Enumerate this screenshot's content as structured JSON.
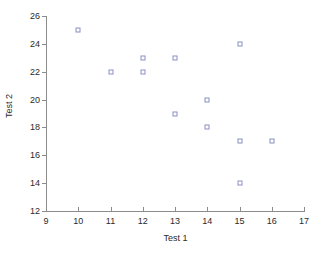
{
  "chart_data": {
    "type": "scatter",
    "title": "",
    "xlabel": "Test 1",
    "ylabel": "Test 2",
    "xlim": [
      9,
      17
    ],
    "ylim": [
      12,
      26
    ],
    "grid": false,
    "legend": null,
    "x_ticks": [
      9,
      10,
      11,
      12,
      13,
      14,
      15,
      16,
      17
    ],
    "x_tick_labels": [
      "9",
      "10",
      "11",
      "12",
      "13",
      "14",
      "15",
      "16",
      "17"
    ],
    "y_ticks": [
      12,
      14,
      16,
      18,
      20,
      22,
      24,
      26
    ],
    "y_tick_labels": [
      "12",
      "14",
      "16",
      "18",
      "20",
      "22",
      "24",
      "26"
    ],
    "marker": "open-square",
    "marker_color": "#8a8fc4",
    "axis_color": "#8c8c8c",
    "points": [
      {
        "x": 10,
        "y": 25
      },
      {
        "x": 11,
        "y": 22
      },
      {
        "x": 12,
        "y": 23
      },
      {
        "x": 12,
        "y": 22
      },
      {
        "x": 13,
        "y": 23
      },
      {
        "x": 13,
        "y": 19
      },
      {
        "x": 14,
        "y": 20
      },
      {
        "x": 14,
        "y": 18
      },
      {
        "x": 15,
        "y": 24
      },
      {
        "x": 15,
        "y": 17
      },
      {
        "x": 15,
        "y": 14
      },
      {
        "x": 16,
        "y": 17
      }
    ],
    "series": [
      {
        "name": "Test scores",
        "x": [
          10,
          11,
          12,
          12,
          13,
          13,
          14,
          14,
          15,
          15,
          15,
          16
        ],
        "values": [
          25,
          22,
          23,
          22,
          23,
          19,
          20,
          18,
          24,
          17,
          14,
          17
        ]
      }
    ]
  }
}
